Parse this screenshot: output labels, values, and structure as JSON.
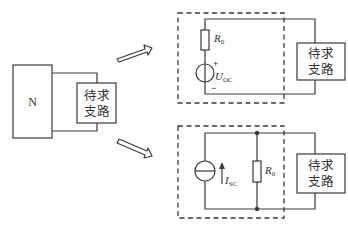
{
  "left_network": {
    "network_label": "N",
    "branch_label_line1": "待求",
    "branch_label_line2": "支路"
  },
  "thevenin_equivalent": {
    "resistor_label": "R",
    "resistor_subscript": "0",
    "source_label": "U",
    "source_subscript": "OC",
    "plus_sign": "+",
    "minus_sign": "−",
    "branch_label_line1": "待求",
    "branch_label_line2": "支路"
  },
  "norton_equivalent": {
    "source_label": "I",
    "source_subscript": "SC",
    "resistor_label": "R",
    "resistor_subscript": "0",
    "branch_label_line1": "待求",
    "branch_label_line2": "支路"
  },
  "colors": {
    "line": "#3a3a3a",
    "text": "#333333",
    "background": "#ffffff"
  }
}
